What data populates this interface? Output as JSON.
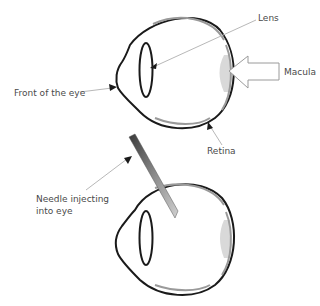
{
  "diagram": {
    "top_eye": {
      "labels": {
        "lens": "Lens",
        "macula": "Macula",
        "front": "Front of the eye",
        "retina": "Retina"
      }
    },
    "bottom_eye": {
      "labels": {
        "needle_line1": "Needle injecting",
        "needle_line2": "into eye"
      }
    },
    "colors": {
      "outline": "#1a1a1a",
      "retina": "#9a9a9a",
      "macula": "#d6d6d6",
      "leader": "#b0b0b0",
      "text": "#4a4a4a"
    }
  }
}
